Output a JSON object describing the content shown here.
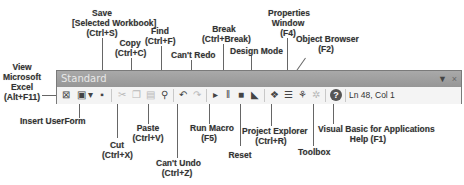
{
  "toolbar": {
    "title": "Standard",
    "controls": {
      "dropdown_glyph": "▼",
      "close_glyph": "×"
    },
    "status": "Ln 48, Col 1",
    "buttons": [
      {
        "id": "view-excel",
        "icon": "excel-icon",
        "glyph": "⊠",
        "enabled": true
      },
      {
        "id": "insert-userform",
        "icon": "userform-icon",
        "glyph": "▣",
        "enabled": true
      },
      {
        "id": "insert-dropdown",
        "icon": "chevron-down-icon",
        "glyph": "▾",
        "enabled": true
      },
      {
        "id": "save",
        "icon": "save-icon",
        "glyph": "▪",
        "enabled": true
      },
      {
        "id": "cut",
        "icon": "scissors-icon",
        "glyph": "✂",
        "enabled": false
      },
      {
        "id": "copy",
        "icon": "copy-icon",
        "glyph": "❐",
        "enabled": false
      },
      {
        "id": "paste",
        "icon": "paste-icon",
        "glyph": "▤",
        "enabled": false
      },
      {
        "id": "find",
        "icon": "binoculars-icon",
        "glyph": "⚲",
        "enabled": true
      },
      {
        "id": "undo",
        "icon": "undo-icon",
        "glyph": "↶",
        "enabled": true
      },
      {
        "id": "redo",
        "icon": "redo-icon",
        "glyph": "↷",
        "enabled": false
      },
      {
        "id": "run",
        "icon": "play-icon",
        "glyph": "▸",
        "enabled": true
      },
      {
        "id": "break",
        "icon": "pause-icon",
        "glyph": "‖",
        "enabled": true
      },
      {
        "id": "reset",
        "icon": "stop-icon",
        "glyph": "■",
        "enabled": true
      },
      {
        "id": "design-mode",
        "icon": "design-mode-icon",
        "glyph": "◣",
        "enabled": true
      },
      {
        "id": "project-explorer",
        "icon": "project-explorer-icon",
        "glyph": "❖",
        "enabled": true
      },
      {
        "id": "properties",
        "icon": "properties-icon",
        "glyph": "☰",
        "enabled": true
      },
      {
        "id": "object-browser",
        "icon": "object-browser-icon",
        "glyph": "⚘",
        "enabled": true
      },
      {
        "id": "toolbox",
        "icon": "toolbox-icon",
        "glyph": "✲",
        "enabled": false
      },
      {
        "id": "help",
        "icon": "help-icon",
        "glyph": "?",
        "enabled": true
      }
    ]
  },
  "callouts": {
    "view_excel": [
      "View",
      "Microsoft",
      "Excel",
      "(Alt+F11)"
    ],
    "save": [
      "Save",
      "[Selected Workbook]",
      "(Ctrl+S)"
    ],
    "copy": [
      "Copy",
      "(Ctrl+C)"
    ],
    "find": [
      "Find",
      "(Ctrl+F)"
    ],
    "cant_redo": [
      "Can't Redo"
    ],
    "break": [
      "Break",
      "(Ctrl+Break)"
    ],
    "design_mode": [
      "Design Mode"
    ],
    "properties": [
      "Properties",
      "Window",
      "(F4)"
    ],
    "object_browser": [
      "Object Browser",
      "(F2)"
    ],
    "insert_userform": [
      "Insert UserForm"
    ],
    "cut": [
      "Cut",
      "(Ctrl+X)"
    ],
    "paste": [
      "Paste",
      "(Ctrl+V)"
    ],
    "cant_undo": [
      "Can't Undo",
      "(Ctrl+Z)"
    ],
    "run_macro": [
      "Run Macro",
      "(F5)"
    ],
    "reset": [
      "Reset"
    ],
    "project_explorer": [
      "Project Explorer",
      "(Ctrl+R)"
    ],
    "toolbox": [
      "Toolbox"
    ],
    "vba_help": [
      "Visual Basic for Applications",
      "Help (F1)"
    ]
  }
}
